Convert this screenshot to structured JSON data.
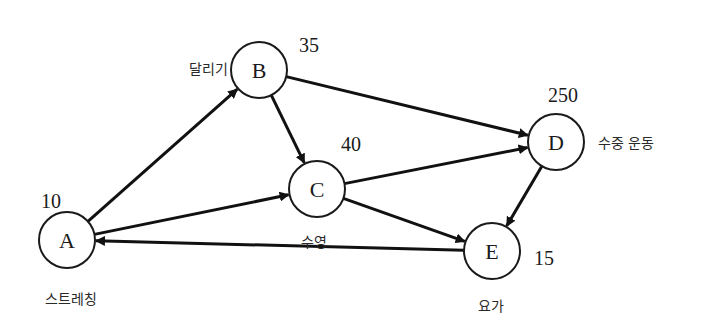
{
  "diagram": {
    "type": "directed-graph",
    "nodes": [
      {
        "id": "A",
        "letter": "A",
        "weight": "10",
        "label": "스트레칭",
        "cx": 67,
        "cy": 240
      },
      {
        "id": "B",
        "letter": "B",
        "weight": "35",
        "label": "달리기",
        "cx": 259,
        "cy": 70
      },
      {
        "id": "C",
        "letter": "C",
        "weight": "40",
        "label": "수영",
        "cx": 317,
        "cy": 189
      },
      {
        "id": "D",
        "letter": "D",
        "weight": "250",
        "label": "수중 운동",
        "cx": 556,
        "cy": 142
      },
      {
        "id": "E",
        "letter": "E",
        "weight": "15",
        "label": "요가",
        "cx": 492,
        "cy": 251
      }
    ],
    "edges": [
      {
        "from": "A",
        "to": "B"
      },
      {
        "from": "A",
        "to": "C"
      },
      {
        "from": "B",
        "to": "C"
      },
      {
        "from": "B",
        "to": "D"
      },
      {
        "from": "C",
        "to": "D"
      },
      {
        "from": "C",
        "to": "E"
      },
      {
        "from": "D",
        "to": "E"
      },
      {
        "from": "E",
        "to": "A"
      }
    ],
    "colors": {
      "stroke": "#111111",
      "background": "#ffffff"
    }
  }
}
